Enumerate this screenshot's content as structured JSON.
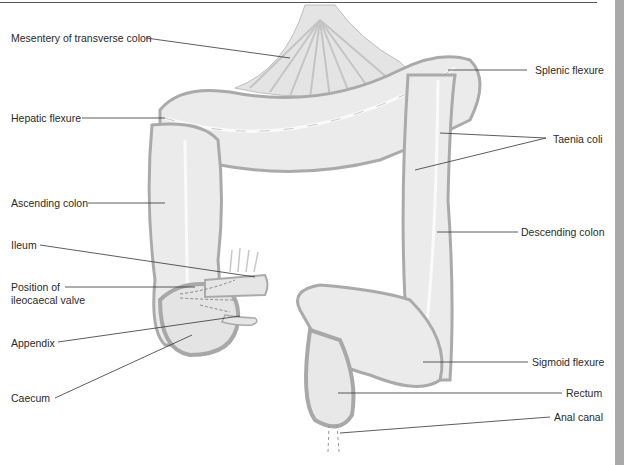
{
  "diagram": {
    "title": "",
    "colors": {
      "tissue_fill": "#ebebeb",
      "tissue_shade": "#c2c2c2",
      "tissue_outline": "#a8a8a8",
      "mesentery": "#d9d9d9",
      "leader_line": "#333333",
      "text": "#2a2a2a",
      "side_bar": "#a9a9a9"
    },
    "labels_left": [
      {
        "id": "mesentery",
        "text": "Mesentery of transverse colon"
      },
      {
        "id": "hepatic",
        "text": "Hepatic flexure"
      },
      {
        "id": "ascending",
        "text": "Ascending colon"
      },
      {
        "id": "ileum",
        "text": "Ileum"
      },
      {
        "id": "valve",
        "text": "Position of",
        "text2": "ileocaecal valve"
      },
      {
        "id": "appendix",
        "text": "Appendix"
      },
      {
        "id": "caecum",
        "text": "Caecum"
      }
    ],
    "labels_right": [
      {
        "id": "splenic",
        "text": "Splenic flexure"
      },
      {
        "id": "taenia",
        "text": "Taenia coli"
      },
      {
        "id": "descending",
        "text": "Descending colon"
      },
      {
        "id": "sigmoid",
        "text": "Sigmoid flexure"
      },
      {
        "id": "rectum",
        "text": "Rectum"
      },
      {
        "id": "anal",
        "text": "Anal canal"
      }
    ]
  }
}
